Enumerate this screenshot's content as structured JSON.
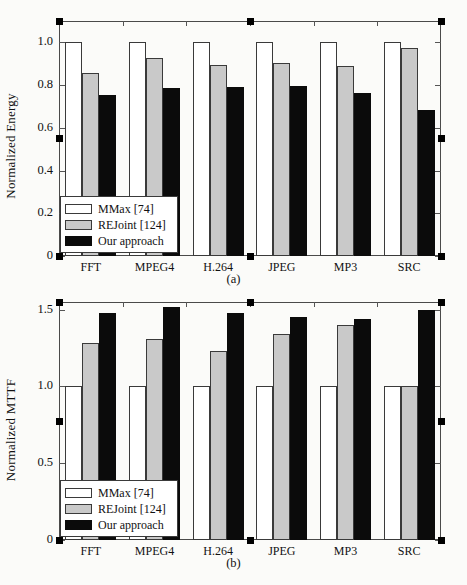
{
  "figure": {
    "background_color": "#fbfbf9",
    "frame_color": "#4a4a4a",
    "handle_color": "#000000"
  },
  "series_styles": [
    {
      "name": "MMax [74]",
      "color": "#ffffff"
    },
    {
      "name": "REJoint [124]",
      "color": "#c9c9c9"
    },
    {
      "name": "Our approach",
      "color": "#0b0b0b"
    }
  ],
  "legend": {
    "items": [
      {
        "label": "MMax [74]",
        "swatch": "white-swatch"
      },
      {
        "label": "REJoint [124]",
        "swatch": "gray-swatch"
      },
      {
        "label": "Our approach",
        "swatch": "black-swatch"
      }
    ]
  },
  "panel_a": {
    "caption": "(a)",
    "ylabel": "Normalized Energy",
    "yticks": [
      "0",
      "0.2",
      "0.4",
      "0.6",
      "0.8",
      "1.0"
    ],
    "xticks": [
      "FFT",
      "MPEG4",
      "H.264",
      "JPEG",
      "MP3",
      "SRC"
    ]
  },
  "panel_b": {
    "caption": "(b)",
    "ylabel": "Normalized MTTF",
    "yticks": [
      "0",
      "0.5",
      "1.0",
      "1.5"
    ],
    "xticks": [
      "FFT",
      "MPEG4",
      "H.264",
      "JPEG",
      "MP3",
      "SRC"
    ]
  },
  "chart_data": [
    {
      "type": "bar",
      "title": "(a)",
      "xlabel": "",
      "ylabel": "Normalized Energy",
      "ylim": [
        0,
        1.1
      ],
      "yticks": [
        0,
        0.2,
        0.4,
        0.6,
        0.8,
        1.0
      ],
      "ytick_labels": [
        "0",
        "0.2",
        "0.4",
        "0.6",
        "0.8",
        "1.0"
      ],
      "grid": false,
      "legend_position": "lower-left",
      "categories": [
        "FFT",
        "MPEG4",
        "H.264",
        "JPEG",
        "MP3",
        "SRC"
      ],
      "series": [
        {
          "name": "MMax [74]",
          "color": "#ffffff",
          "values": [
            1.0,
            1.0,
            1.0,
            1.0,
            1.0,
            1.0
          ]
        },
        {
          "name": "REJoint [124]",
          "color": "#c9c9c9",
          "values": [
            0.855,
            0.925,
            0.895,
            0.905,
            0.89,
            0.975
          ]
        },
        {
          "name": "Our approach",
          "color": "#0b0b0b",
          "values": [
            0.755,
            0.785,
            0.79,
            0.795,
            0.765,
            0.685
          ]
        }
      ]
    },
    {
      "type": "bar",
      "title": "(b)",
      "xlabel": "",
      "ylabel": "Normalized MTTF",
      "ylim": [
        0,
        1.55
      ],
      "yticks": [
        0,
        0.5,
        1.0,
        1.5
      ],
      "ytick_labels": [
        "0",
        "0.5",
        "1.0",
        "1.5"
      ],
      "grid": false,
      "legend_position": "lower-left",
      "categories": [
        "FFT",
        "MPEG4",
        "H.264",
        "JPEG",
        "MP3",
        "SRC"
      ],
      "series": [
        {
          "name": "MMax [74]",
          "color": "#ffffff",
          "values": [
            1.0,
            1.0,
            1.0,
            1.0,
            1.0,
            1.0
          ]
        },
        {
          "name": "REJoint [124]",
          "color": "#c9c9c9",
          "values": [
            1.28,
            1.31,
            1.23,
            1.34,
            1.4,
            1.0
          ]
        },
        {
          "name": "Our approach",
          "color": "#0b0b0b",
          "values": [
            1.48,
            1.52,
            1.48,
            1.45,
            1.44,
            1.5
          ]
        }
      ]
    }
  ]
}
